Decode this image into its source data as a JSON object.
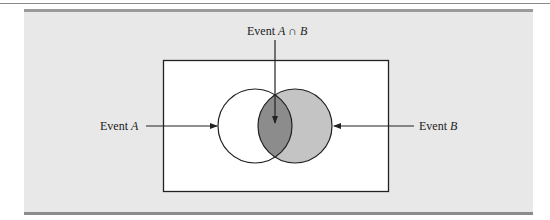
{
  "diagram": {
    "type": "venn",
    "labels": {
      "intersection_prefix": "Event ",
      "intersection_a": "A",
      "intersection_op": " ∩ ",
      "intersection_b": "B",
      "event_a_prefix": "Event ",
      "event_a_var": "A",
      "event_b_prefix": "Event ",
      "event_b_var": "B"
    },
    "colors": {
      "panel_bg": "#e8e8e8",
      "sample_space_fill": "#ffffff",
      "event_a_fill": "#ffffff",
      "event_b_fill": "#c4c4c4",
      "intersection_fill": "#8c8c8c",
      "stroke": "#222222"
    }
  }
}
